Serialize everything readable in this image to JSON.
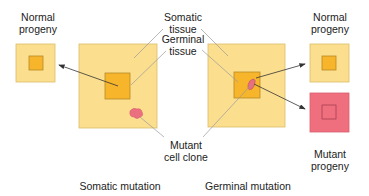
{
  "labels": {
    "left_progeny": [
      "Normal",
      "progeny"
    ],
    "somatic_tissue": [
      "Somatic",
      "tissue"
    ],
    "germinal_tissue": [
      "Germinal",
      "tissue"
    ],
    "mutant_clone": [
      "Mutant",
      "cell clone"
    ],
    "right_normal_progeny": [
      "Normal",
      "progeny"
    ],
    "mutant_progeny": [
      "Mutant",
      "progeny"
    ],
    "somatic_mutation": "Somatic mutation",
    "germinal_mutation": "Germinal mutation"
  },
  "colors": {
    "somatic_fill": "#fbdf8e",
    "germinal_fill": "#f6b52a",
    "border": "#c9a24a",
    "mutant_fill": "#ef6f7e",
    "mutant_border": "#c25060",
    "clone_fill": "#e8707e",
    "leader_line": "#9a9a9a",
    "arrow": "#333333"
  }
}
